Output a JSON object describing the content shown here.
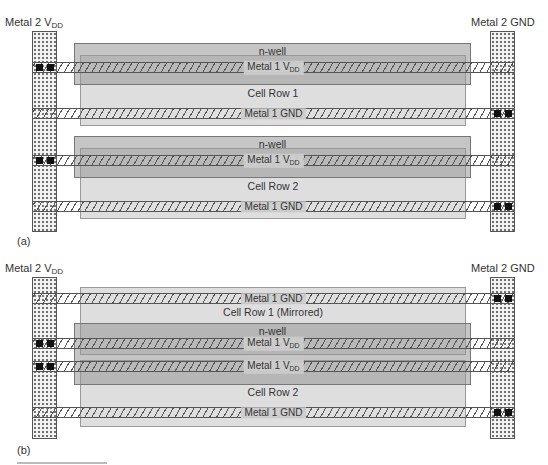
{
  "panels": [
    {
      "id": "a",
      "label": "(a)",
      "left_rail": {
        "label": "Metal 2 V",
        "sub": "DD"
      },
      "right_rail": {
        "label": "Metal 2 GND"
      },
      "rows": [
        {
          "nwell_label": "n-well",
          "vdd_label": "Metal 1 V",
          "vdd_sub": "DD",
          "cell_label": "Cell Row 1",
          "gnd_label": "Metal 1 GND"
        },
        {
          "nwell_label": "n-well",
          "vdd_label": "Metal 1 V",
          "vdd_sub": "DD",
          "cell_label": "Cell Row 2",
          "gnd_label": "Metal 1 GND"
        }
      ]
    },
    {
      "id": "b",
      "label": "(b)",
      "left_rail": {
        "label": "Metal 2 V",
        "sub": "DD"
      },
      "right_rail": {
        "label": "Metal 2 GND"
      },
      "row1": {
        "gnd_label": "Metal 1 GND",
        "cell_label": "Cell Row 1 (Mirrored)",
        "vdd_label": "Metal 1 V",
        "vdd_sub": "DD"
      },
      "nwell_label": "n-well",
      "row2": {
        "vdd_label": "Metal 1 V",
        "vdd_sub": "DD",
        "cell_label": "Cell Row 2",
        "gnd_label": "Metal 1 GND"
      }
    }
  ],
  "colors": {
    "rail_fill": "#f2f2f2",
    "nwell_fill": "#969696",
    "cell_fill": "#c3c3c3",
    "via": "#111111",
    "stroke": "#555555"
  }
}
